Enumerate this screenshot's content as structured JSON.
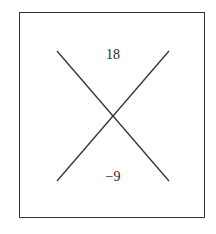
{
  "diagram": {
    "type": "x-factor-diagram",
    "top_value": "18",
    "bottom_value": "−9",
    "left_value": "",
    "right_value": "",
    "line_color": "#333333"
  }
}
